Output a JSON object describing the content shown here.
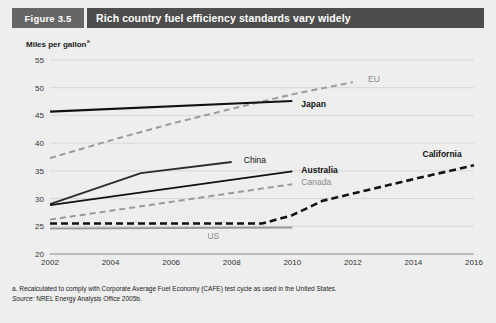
{
  "figure": {
    "number_label": "Figure 3.5",
    "title": "Rich country fuel efficiency standards vary widely"
  },
  "notes": {
    "footnote_a": "a. Recalculated to comply with Corporate Average Fuel Economy (CAFE) test cycle as used in the United States.",
    "source_prefix": "Source:",
    "source_text": " NREL Energy Analysis Office 2005b."
  },
  "colors": {
    "panel_bg": "#eeeeee",
    "title_band": "#4d4d4d",
    "number_band": "#666666",
    "gridline": "#cfcfcf",
    "axis_line": "#8a8a8a",
    "dark_series": "#111111",
    "gray_series": "#9a9a9a",
    "mid_series": "#2b2b2b"
  },
  "chart_data": {
    "type": "line",
    "title": "Rich country fuel efficiency standards vary widely",
    "xlabel": "",
    "ylabel": "Miles per gallon",
    "ylabel_superscript": "a",
    "xlim": [
      2002,
      2016
    ],
    "ylim": [
      20,
      55
    ],
    "yticks": [
      20,
      25,
      30,
      35,
      40,
      45,
      50,
      55
    ],
    "xticks": [
      2002,
      2004,
      2006,
      2008,
      2010,
      2012,
      2014,
      2016
    ],
    "grid": "horizontal",
    "legend": "inline-labels",
    "series": [
      {
        "name": "EU",
        "style": "dashed",
        "color": "#9a9a9a",
        "width": 2.0,
        "label_weight": "normal",
        "label_color": "gray",
        "label_x": 2012.5,
        "label_y": 51.5,
        "x": [
          2002,
          2004,
          2006,
          2008,
          2010,
          2012
        ],
        "y": [
          37.3,
          40.5,
          43.5,
          46.2,
          48.8,
          51.0
        ]
      },
      {
        "name": "Japan",
        "style": "solid",
        "color": "#111111",
        "width": 2.2,
        "label_weight": "bold",
        "label_color": "dark",
        "label_x": 2010.3,
        "label_y": 47.0,
        "x": [
          2002,
          2010
        ],
        "y": [
          45.7,
          47.6
        ]
      },
      {
        "name": "China",
        "style": "solid",
        "color": "#2b2b2b",
        "width": 1.8,
        "label_weight": "normal",
        "label_color": "dark",
        "label_x": 2008.4,
        "label_y": 37.0,
        "x": [
          2002,
          2005,
          2008
        ],
        "y": [
          29.0,
          34.6,
          36.6
        ]
      },
      {
        "name": "Australia",
        "style": "solid",
        "color": "#111111",
        "width": 1.8,
        "label_weight": "bold",
        "label_color": "dark",
        "label_x": 2010.3,
        "label_y": 35.2,
        "x": [
          2002,
          2010
        ],
        "y": [
          28.8,
          34.9
        ]
      },
      {
        "name": "Canada",
        "style": "dashed",
        "color": "#9a9a9a",
        "width": 2.0,
        "label_weight": "normal",
        "label_color": "gray",
        "label_x": 2010.3,
        "label_y": 33.0,
        "x": [
          2002,
          2010
        ],
        "y": [
          26.2,
          32.6
        ]
      },
      {
        "name": "California",
        "style": "dashed",
        "color": "#111111",
        "width": 2.6,
        "label_weight": "bold",
        "label_color": "dark",
        "label_x": 2014.3,
        "label_y": 38.0,
        "x": [
          2002,
          2009,
          2010,
          2011,
          2012,
          2014,
          2016
        ],
        "y": [
          25.5,
          25.5,
          27.0,
          29.6,
          30.9,
          33.5,
          36.0
        ]
      },
      {
        "name": "US",
        "style": "solid",
        "color": "#9a9a9a",
        "width": 2.0,
        "label_weight": "normal",
        "label_color": "gray",
        "label_x": 2007.2,
        "label_y": 23.2,
        "x": [
          2002,
          2010
        ],
        "y": [
          24.6,
          24.8
        ]
      }
    ]
  }
}
